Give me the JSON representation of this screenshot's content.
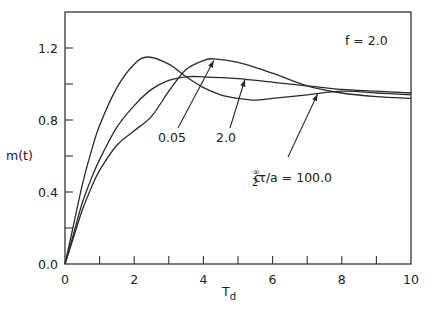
{
  "chart_data": {
    "type": "line",
    "title": "",
    "xlabel": "T_d",
    "ylabel": "m(t)",
    "xlim": [
      0,
      10
    ],
    "ylim": [
      0.0,
      1.41
    ],
    "grid": false,
    "legend": "none (curves labeled by arrows)",
    "x_ticks": [
      0,
      2,
      4,
      6,
      8,
      10
    ],
    "x_minor_ticks": [
      1,
      3,
      5,
      7,
      9
    ],
    "y_ticks": [
      0.0,
      0.4,
      0.8,
      1.2
    ],
    "y_minor_ticks": [
      0.2,
      0.6,
      1.0
    ],
    "annotation_param": "f=2.0",
    "series": [
      {
        "name": "0.05",
        "x": [
          0,
          0.25,
          0.5,
          0.75,
          1.0,
          1.5,
          2.0,
          2.5,
          3.0,
          3.5,
          4.0,
          4.3,
          5.0,
          6.0,
          7.0,
          8.0,
          9.0,
          10.0
        ],
        "y": [
          0.0,
          0.15,
          0.3,
          0.42,
          0.52,
          0.66,
          0.74,
          0.82,
          0.96,
          1.08,
          1.13,
          1.14,
          1.12,
          1.06,
          0.99,
          0.95,
          0.93,
          0.92
        ]
      },
      {
        "name": "2.0",
        "x": [
          0,
          0.25,
          0.5,
          0.75,
          1.0,
          1.5,
          2.0,
          2.5,
          3.0,
          3.5,
          4.0,
          5.0,
          6.0,
          7.0,
          8.0,
          9.0,
          10.0
        ],
        "y": [
          0.0,
          0.17,
          0.34,
          0.47,
          0.58,
          0.76,
          0.88,
          0.97,
          1.02,
          1.04,
          1.04,
          1.03,
          1.01,
          0.99,
          0.97,
          0.96,
          0.95
        ]
      },
      {
        "name": "100.0",
        "x": [
          0,
          0.25,
          0.5,
          0.75,
          1.0,
          1.5,
          2.0,
          2.4,
          3.0,
          3.5,
          4.0,
          4.5,
          5.0,
          5.5,
          6.0,
          7.0,
          8.0,
          9.0,
          10.0
        ],
        "y": [
          0.0,
          0.22,
          0.44,
          0.62,
          0.77,
          0.98,
          1.11,
          1.15,
          1.11,
          1.04,
          0.98,
          0.94,
          0.92,
          0.91,
          0.92,
          0.94,
          0.96,
          0.95,
          0.94
        ]
      }
    ],
    "annotations": [
      {
        "text": "f=2.0",
        "x": 8.9,
        "y": 1.3
      },
      {
        "text": "0.05",
        "x": 2.8,
        "y": 0.72,
        "arrow_to": [
          4.3,
          1.14
        ]
      },
      {
        "text": "2.0",
        "x": 4.45,
        "y": 0.72,
        "arrow_to": [
          5.2,
          1.03
        ]
      },
      {
        "text": "c₂^∞τ/a=100.0",
        "x": 5.2,
        "y": 0.55,
        "arrow_to": [
          7.2,
          0.95
        ]
      }
    ]
  },
  "labels": {
    "ylabel": "m(t)",
    "xlabel_main": "T",
    "xlabel_sub": "d",
    "param": "f = 2.0",
    "curve_a": "0.05",
    "curve_b": "2.0",
    "curve_c_prefix": "c",
    "curve_c_sup": "∞",
    "curve_c_sub": "2",
    "curve_c_rest": "τ/a = 100.0"
  }
}
